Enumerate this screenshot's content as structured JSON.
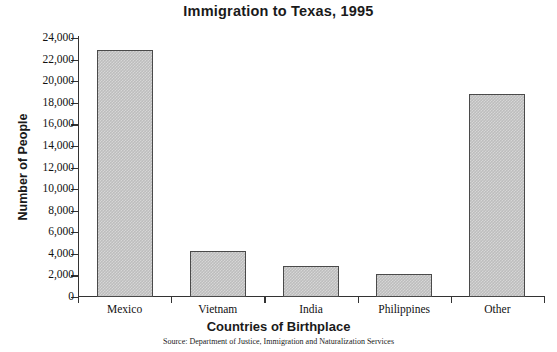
{
  "chart_data": {
    "type": "bar",
    "title": "Immigration to Texas, 1995",
    "xlabel": "Countries of Birthplace",
    "ylabel": "Number of People",
    "categories": [
      "Mexico",
      "Vietnam",
      "India",
      "Philippines",
      "Other"
    ],
    "values": [
      22900,
      4250,
      2850,
      2150,
      18800
    ],
    "ylim": [
      0,
      24000
    ],
    "ytick_step": 2000,
    "ytick_labels": [
      "0",
      "2,000",
      "4,000",
      "6,000",
      "8,000",
      "10,000",
      "12,000",
      "14,000",
      "16,000",
      "18,000",
      "20,000",
      "22,000",
      "24,000"
    ],
    "ytick_values": [
      0,
      2000,
      4000,
      6000,
      8000,
      10000,
      12000,
      14000,
      16000,
      18000,
      20000,
      22000,
      24000
    ],
    "grid": false,
    "legend": false,
    "source_note": "Source: Department of Justice, Immigration and Naturalization Services",
    "bar_fill_color": "#bdbdbd",
    "bar_border_color": "#4a4a4a",
    "axis_color": "#333333",
    "background_color": "#ffffff"
  }
}
